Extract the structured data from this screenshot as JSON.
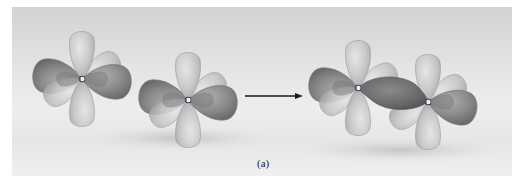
{
  "figure": {
    "caption_label": "(a)",
    "atoms": [
      {
        "id": "carbon-1",
        "symbol": "C",
        "group": "separate",
        "cx": 82,
        "cy": 79
      },
      {
        "id": "carbon-2",
        "symbol": "C",
        "group": "separate",
        "cx": 188,
        "cy": 100
      },
      {
        "id": "carbon-3",
        "symbol": "C",
        "group": "bonded",
        "cx": 358,
        "cy": 88
      },
      {
        "id": "carbon-4",
        "symbol": "C",
        "group": "bonded",
        "cx": 428,
        "cy": 102
      }
    ],
    "arrow": {
      "direction": "right",
      "x1": 245,
      "x2": 303,
      "y": 96
    },
    "colors": {
      "background_top": "#d2d2d2",
      "background_bottom": "#f0f0f0",
      "light_lobe": "#c9c9c9",
      "dark_lobe": "#8e8e8e",
      "bond_lobe": "#6e6e6e",
      "arrow": "#1a1a1a"
    }
  }
}
